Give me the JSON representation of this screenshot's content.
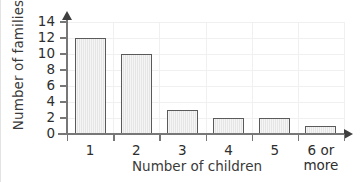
{
  "chart_data": {
    "type": "bar",
    "title": "",
    "xlabel": "Number of children",
    "ylabel": "Number of families",
    "categories": [
      "1",
      "2",
      "3",
      "4",
      "5",
      "6 or\nmore"
    ],
    "values": [
      12,
      10,
      3,
      2,
      2,
      1
    ],
    "ylim": [
      0,
      14
    ],
    "yticks": [
      0,
      2,
      4,
      6,
      8,
      10,
      12,
      14
    ],
    "ytick_labels": [
      "0",
      "2",
      "4",
      "6",
      "8",
      "10",
      "12",
      "14"
    ],
    "xtick_labels": [
      "1",
      "2",
      "3",
      "4",
      "5",
      "6 or more"
    ],
    "grid": true,
    "legend": "none",
    "colors": {
      "bar_fill": "#e9e9e9",
      "bar_border": "#5a5a5a",
      "axis": "#777777",
      "gridline": "#f0f0f0",
      "text": "#2e2e2e",
      "background": "#ffffff"
    }
  },
  "axes": {
    "y_title": "Number of families",
    "x_title": "Number of children"
  },
  "category_labels": [
    {
      "line1": "1",
      "line2": ""
    },
    {
      "line1": "2",
      "line2": ""
    },
    {
      "line1": "3",
      "line2": ""
    },
    {
      "line1": "4",
      "line2": ""
    },
    {
      "line1": "5",
      "line2": ""
    },
    {
      "line1": "6 or",
      "line2": "more"
    }
  ],
  "y_tick_labels": [
    "0",
    "2",
    "4",
    "6",
    "8",
    "10",
    "12",
    "14"
  ]
}
